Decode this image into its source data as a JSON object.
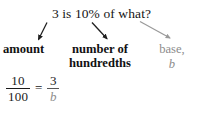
{
  "diagram": {
    "question": "3 is 10% of what?",
    "labels": {
      "amount": "amount",
      "hundredths_line1": "number of",
      "hundredths_line2": "hundredths",
      "base_line1": "base,",
      "base_line2": "b"
    },
    "equation": {
      "left_numerator": "10",
      "left_denominator": "100",
      "equals": "=",
      "right_numerator": "3",
      "right_denominator": "b"
    },
    "arrows": [
      {
        "name": "arrow-to-amount",
        "color": "#1f1f1f"
      },
      {
        "name": "arrow-to-hundredths",
        "color": "#1f1f1f"
      },
      {
        "name": "arrow-to-base",
        "color": "#9a9a9a"
      }
    ],
    "colors": {
      "text": "#141414",
      "muted": "#8d8d8d",
      "background": "#ffffff"
    }
  }
}
